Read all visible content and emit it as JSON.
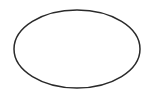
{
  "canvas": {
    "width": 150,
    "height": 96,
    "background": "#ffffff"
  },
  "shapes": [
    {
      "type": "ellipse",
      "cx": 77,
      "cy": 49,
      "rx": 63,
      "ry": 39,
      "stroke": "#2a2a2a",
      "stroke_width": 1.5,
      "fill": "none"
    }
  ]
}
